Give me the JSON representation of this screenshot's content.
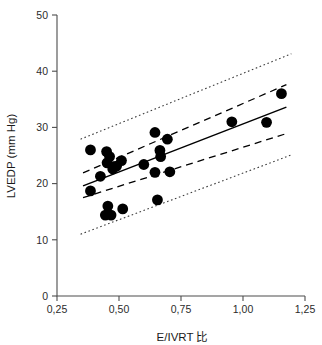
{
  "chart_data": {
    "type": "scatter",
    "title": "",
    "subtitle": "",
    "xlabel": "E/IVRT 比",
    "ylabel": "LVEDP (mm Hg)",
    "xlim": [
      0.25,
      1.25
    ],
    "ylim": [
      0,
      50
    ],
    "xticks": [
      0.25,
      0.5,
      0.75,
      1.0,
      1.25
    ],
    "xticklabels": [
      "0,25",
      "0,50",
      "0,75",
      "1,00",
      "1,25"
    ],
    "yticks": [
      0,
      10,
      20,
      30,
      40,
      50
    ],
    "yticklabels": [
      "0",
      "10",
      "20",
      "30",
      "40",
      "50"
    ],
    "grid": false,
    "legend": null,
    "decimal_separator": "comma",
    "marker": {
      "shape": "circle",
      "color": "#000000",
      "size": 5.4
    },
    "points": [
      {
        "x": 0.385,
        "y": 26.0
      },
      {
        "x": 0.385,
        "y": 18.7
      },
      {
        "x": 0.425,
        "y": 21.3
      },
      {
        "x": 0.45,
        "y": 25.7
      },
      {
        "x": 0.455,
        "y": 16.0
      },
      {
        "x": 0.445,
        "y": 14.4
      },
      {
        "x": 0.462,
        "y": 24.8
      },
      {
        "x": 0.468,
        "y": 14.4
      },
      {
        "x": 0.452,
        "y": 23.7
      },
      {
        "x": 0.475,
        "y": 22.6
      },
      {
        "x": 0.478,
        "y": 23.0
      },
      {
        "x": 0.49,
        "y": 23.1
      },
      {
        "x": 0.51,
        "y": 24.1
      },
      {
        "x": 0.515,
        "y": 15.5
      },
      {
        "x": 0.6,
        "y": 23.4
      },
      {
        "x": 0.645,
        "y": 29.1
      },
      {
        "x": 0.645,
        "y": 22.0
      },
      {
        "x": 0.655,
        "y": 17.1
      },
      {
        "x": 0.665,
        "y": 25.9
      },
      {
        "x": 0.668,
        "y": 24.8
      },
      {
        "x": 0.695,
        "y": 27.9
      },
      {
        "x": 0.705,
        "y": 22.1
      },
      {
        "x": 0.955,
        "y": 31.0
      },
      {
        "x": 1.095,
        "y": 30.9
      },
      {
        "x": 1.155,
        "y": 36.0
      }
    ],
    "fit_line": {
      "style": "solid",
      "x": [
        0.355,
        1.175
      ],
      "y": [
        19.6,
        33.6
      ]
    },
    "confidence_band": {
      "style": "dashed",
      "label": "95% confidence interval",
      "upper": {
        "x": [
          0.355,
          1.175
        ],
        "y": [
          21.9,
          37.6
        ]
      },
      "lower": {
        "x": [
          0.355,
          1.175
        ],
        "y": [
          17.5,
          28.9
        ]
      }
    },
    "prediction_band": {
      "style": "dotted",
      "label": "95% prediction interval",
      "upper": {
        "x": [
          0.345,
          1.195
        ],
        "y": [
          27.9,
          43.1
        ]
      },
      "lower": {
        "x": [
          0.345,
          1.195
        ],
        "y": [
          11.0,
          25.1
        ]
      }
    }
  },
  "axes": {
    "x_title": "E/IVRT 比",
    "y_title": "LVEDP (mm Hg)"
  },
  "colors": {
    "marker": "#000000",
    "fit": "#000000",
    "axis": "#4d4d4d",
    "background": "#ffffff"
  }
}
